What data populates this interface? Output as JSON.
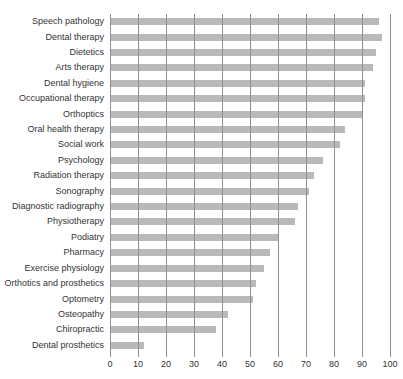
{
  "page": {
    "background": "#ffffff",
    "top_caption_fragment": "Figure: percentage of women in selected health professions"
  },
  "chart_data": {
    "type": "bar",
    "orientation": "horizontal",
    "title": "",
    "xlabel": "",
    "ylabel": "",
    "xlim": [
      0,
      100
    ],
    "x_ticks": [
      0,
      10,
      20,
      30,
      40,
      50,
      60,
      70,
      80,
      90,
      100
    ],
    "grid": "vertical-on",
    "legend": "none",
    "categories": [
      "Speech pathology",
      "Dental therapy",
      "Dietetics",
      "Arts therapy",
      "Dental hygiene",
      "Occupational therapy",
      "Orthoptics",
      "Oral health therapy",
      "Social work",
      "Psychology",
      "Radiation therapy",
      "Sonography",
      "Diagnostic radiography",
      "Physiotherapy",
      "Podiatry",
      "Pharmacy",
      "Exercise physiology",
      "Orthotics and prosthetics",
      "Optometry",
      "Osteopathy",
      "Chiropractic",
      "Dental prosthetics"
    ],
    "values": [
      96,
      97,
      95,
      94,
      91,
      91,
      90,
      84,
      82,
      76,
      73,
      71,
      67,
      66,
      60,
      57,
      55,
      52,
      51,
      42,
      38,
      12
    ],
    "bar_color": "#b9b9b9",
    "gridline_color": "#8f8f8f",
    "text_color": "#333333"
  }
}
